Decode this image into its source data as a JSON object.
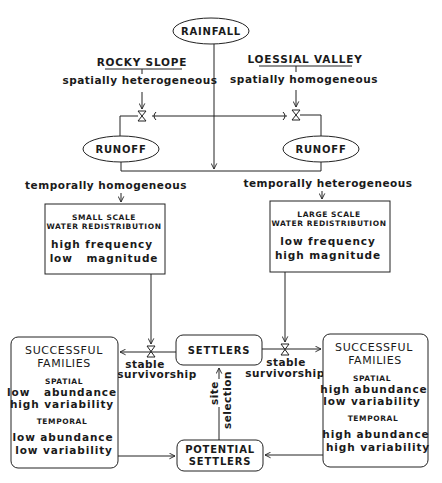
{
  "nodes": {
    "rainfall": "RAINFALL",
    "rocky_slope": {
      "title": "ROCKY SLOPE",
      "property": "spatially heterogeneous"
    },
    "loessial_valley": {
      "title": "LOESSIAL VALLEY",
      "property": "spatially homogeneous"
    },
    "runoff_left": "RUNOFF",
    "runoff_right": "RUNOFF",
    "temporal_left": "temporally homogeneous",
    "temporal_right": "temporally heterogeneous",
    "small_scale": {
      "line1": "SMALL SCALE",
      "line2": "WATER REDISTRIBUTION",
      "line3": "high frequency",
      "line4": "low   magnitude"
    },
    "large_scale": {
      "line1": "LARGE SCALE",
      "line2": "WATER REDISTRIBUTION",
      "line3": "low frequency",
      "line4": "high magnitude"
    },
    "settlers": "SETTLERS",
    "potential_settlers": {
      "line1": "POTENTIAL",
      "line2": "SETTLERS"
    },
    "survivorship_left": {
      "line1": "stable",
      "line2": "survivorship"
    },
    "survivorship_right": {
      "line1": "stable",
      "line2": "survivorship"
    },
    "site_selection": {
      "line1": "site",
      "line2": "selection"
    },
    "families_left": {
      "title1": "SUCCESSFUL",
      "title2": "FAMILIES",
      "spatial_header": "SPATIAL",
      "spatial_1": "low   abundance",
      "spatial_2": "high variability",
      "temporal_header": "TEMPORAL",
      "temporal_1": "low abundance",
      "temporal_2": "low variability"
    },
    "families_right": {
      "title1": "SUCCESSFUL",
      "title2": "FAMILIES",
      "spatial_header": "SPATIAL",
      "spatial_1": "high abundance",
      "spatial_2": "low variability",
      "temporal_header": "TEMPORAL",
      "temporal_1": "high abundance",
      "temporal_2": "high variability"
    }
  },
  "colors": {
    "line": "#222222",
    "background": "#ffffff",
    "text": "#1a1a1a"
  }
}
